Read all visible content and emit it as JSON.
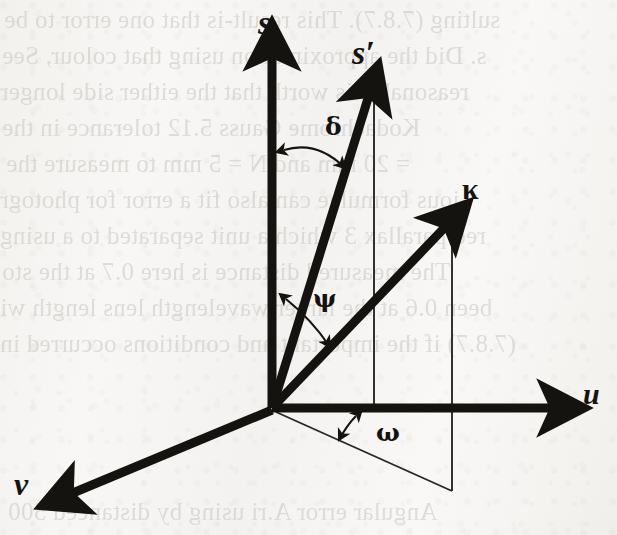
{
  "page": {
    "kind": "scanned-book-figure",
    "width": 617,
    "height": 535,
    "paper_color": "#f6f5f3",
    "ink_color": "#15130f",
    "ghost_color": "#c9c7c2"
  },
  "figure": {
    "type": "3d-vector-diagram",
    "axes": [
      {
        "name": "s-axis",
        "label": "s",
        "direction": "up",
        "label_x": 258,
        "label_y": 8
      },
      {
        "name": "u-axis",
        "label": "u",
        "direction": "right",
        "label_x": 585,
        "label_y": 380
      },
      {
        "name": "v-axis",
        "label": "v",
        "direction": "down-left",
        "label_x": 16,
        "label_y": 470
      }
    ],
    "vectors": [
      {
        "name": "s-prime-vector",
        "label": "s′",
        "label_x": 352,
        "label_y": 38
      },
      {
        "name": "kappa-vector",
        "label": "κ",
        "label_x": 462,
        "label_y": 176
      }
    ],
    "angles": [
      {
        "name": "delta-angle",
        "label": "δ",
        "label_x": 327,
        "label_y": 116,
        "between": "s-axis and s-prime-vector"
      },
      {
        "name": "psi-angle",
        "label": "ψ",
        "label_x": 315,
        "label_y": 288,
        "between": "s-prime-vector and kappa-vector"
      },
      {
        "name": "omega-angle",
        "label": "ω",
        "label_x": 378,
        "label_y": 423,
        "between": "u-axis and kappa projection in u-v plane"
      }
    ],
    "construction_lines": [
      {
        "name": "s-prime-projection-line",
        "kind": "vertical-dropline"
      },
      {
        "name": "kappa-projection-line",
        "kind": "vertical-dropline"
      },
      {
        "name": "kappa-ground-projection",
        "kind": "oblique-line-in-uv-plane"
      }
    ]
  },
  "ghost_text": {
    "note": "faint mirrored bleed-through text from the reverse side of the page",
    "lines": [
      {
        "text": "sulting (7.8.7).  This result-is that one error to be",
        "x": 4,
        "y": 6,
        "size": 26
      },
      {
        "text": "s. Did the approximation using that colour, See",
        "x": 2,
        "y": 42,
        "size": 26
      },
      {
        "text": "reasonable is worth that the either side longer",
        "x": 0,
        "y": 78,
        "size": 26
      },
      {
        "text": "Kodachrome Gauss 5.12 tolerance in the",
        "x": 2,
        "y": 114,
        "size": 26
      },
      {
        "text": "= 20 mm and N = 5 mm to measure the",
        "x": 6,
        "y": 150,
        "size": 26
      },
      {
        "text": "ious formulae can also fit a error for photogr",
        "x": 0,
        "y": 186,
        "size": 26
      },
      {
        "text": "red parallax 3 which a unit separated to a using",
        "x": 0,
        "y": 222,
        "size": 26
      },
      {
        "text": "The measured distance is here 0.7 at the sto",
        "x": 2,
        "y": 258,
        "size": 26
      },
      {
        "text": "been 0.6 at the larger wavelength lens length wi",
        "x": 0,
        "y": 294,
        "size": 26
      },
      {
        "text": "(7.8.7) if the important and conditions occurred in",
        "x": 0,
        "y": 330,
        "size": 26
      },
      {
        "text": "Angular error A.ri using by distanced 500",
        "x": 8,
        "y": 498,
        "size": 26
      }
    ]
  }
}
